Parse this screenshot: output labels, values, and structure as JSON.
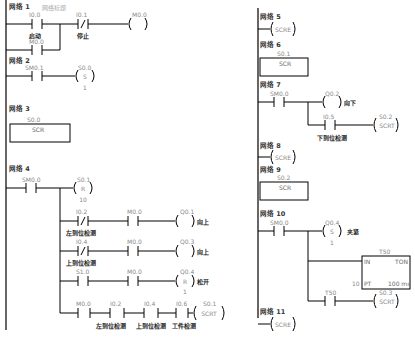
{
  "networks": [
    {
      "id": 1,
      "label": "网络 1",
      "title": "网络标题",
      "elements": [
        {
          "type": "no-contact",
          "addr": "I0.0",
          "comment": "启动"
        },
        {
          "type": "no-contact",
          "addr": "M0.0",
          "parallel": true
        },
        {
          "type": "nc-contact",
          "addr": "I0.1",
          "comment": "停止"
        },
        {
          "type": "coil",
          "addr": "M0.0"
        }
      ]
    },
    {
      "id": 2,
      "label": "网络 2",
      "elements": [
        {
          "type": "no-contact",
          "addr": "SM0.1"
        },
        {
          "type": "set-coil",
          "addr": "S0.0",
          "symbol": "S",
          "count": "1"
        }
      ]
    },
    {
      "id": 3,
      "label": "网络 3",
      "elements": [
        {
          "type": "box",
          "addr": "S0.0",
          "text": "SCR"
        }
      ]
    },
    {
      "id": 4,
      "label": "网络 4",
      "elements": [
        {
          "type": "no-contact",
          "addr": "SM0.0"
        },
        {
          "type": "reset-coil",
          "addr": "S0.1",
          "symbol": "R",
          "count": "10"
        },
        {
          "type": "nc-contact",
          "addr": "I0.2",
          "comment": "左到位检测"
        },
        {
          "type": "no-contact",
          "addr": "M0.0"
        },
        {
          "type": "coil",
          "addr": "Q0.1",
          "comment": "向上"
        },
        {
          "type": "nc-contact",
          "addr": "I0.4",
          "comment": "上到位检测"
        },
        {
          "type": "no-contact",
          "addr": "M0.0"
        },
        {
          "type": "coil",
          "addr": "Q0.3",
          "comment": "向上"
        },
        {
          "type": "no-contact",
          "addr": "S1.0"
        },
        {
          "type": "no-contact",
          "addr": "M0.0"
        },
        {
          "type": "reset-coil",
          "addr": "Q0.4",
          "symbol": "R",
          "count": "1",
          "comment": "松开"
        },
        {
          "type": "no-contact",
          "addr": "M0.0"
        },
        {
          "type": "no-contact",
          "addr": "I0.2",
          "comment": "左到位检测"
        },
        {
          "type": "no-contact",
          "addr": "I0.4",
          "comment": "上到位检测"
        },
        {
          "type": "no-contact",
          "addr": "I0.6",
          "comment": "工件检测"
        },
        {
          "type": "scrt-coil",
          "addr": "S0.1",
          "text": "SCRT"
        }
      ]
    },
    {
      "id": 5,
      "label": "网络 5",
      "elements": [
        {
          "type": "scre-coil",
          "text": "SCRE"
        }
      ]
    },
    {
      "id": 6,
      "label": "网络 6",
      "elements": [
        {
          "type": "box",
          "addr": "S0.1",
          "text": "SCR"
        }
      ]
    },
    {
      "id": 7,
      "label": "网络 7",
      "elements": [
        {
          "type": "no-contact",
          "addr": "SM0.0"
        },
        {
          "type": "coil",
          "addr": "Q0.2",
          "comment": "向下"
        },
        {
          "type": "no-contact",
          "addr": "I0.5",
          "comment": "下到位检测"
        },
        {
          "type": "scrt-coil",
          "addr": "S0.2",
          "text": "SCRT"
        }
      ]
    },
    {
      "id": 8,
      "label": "网络 8",
      "elements": [
        {
          "type": "scre-coil",
          "text": "SCRE"
        }
      ]
    },
    {
      "id": 9,
      "label": "网络 9",
      "elements": [
        {
          "type": "box",
          "addr": "S0.2",
          "text": "SCR"
        }
      ]
    },
    {
      "id": 10,
      "label": "网络 10",
      "elements": [
        {
          "type": "no-contact",
          "addr": "SM0.0"
        },
        {
          "type": "set-coil",
          "addr": "Q0.4",
          "symbol": "S",
          "count": "1",
          "comment": "夹紧"
        },
        {
          "type": "timer",
          "addr": "T50",
          "in": "IN",
          "kind": "TON",
          "pt_value": "10",
          "pt": "PT",
          "base": "100 ms"
        },
        {
          "type": "no-contact",
          "addr": "T50"
        },
        {
          "type": "scrt-coil",
          "addr": "S0.3",
          "text": "SCRT"
        }
      ]
    },
    {
      "id": 11,
      "label": "网络 11",
      "elements": [
        {
          "type": "scre-coil",
          "text": "SCRE"
        }
      ]
    }
  ],
  "t": {
    "n1": "网络 1",
    "n1title": "网络标题",
    "n2": "网络 2",
    "n3": "网络 3",
    "n4": "网络 4",
    "n5": "网络 5",
    "n6": "网络 6",
    "n7": "网络 7",
    "n8": "网络 8",
    "n9": "网络 9",
    "n10": "网络 10",
    "n11": "网络 11",
    "I00": "I0.0",
    "I01": "I0.1",
    "M00": "M0.0",
    "SM01": "SM0.1",
    "S00": "S0.0",
    "S01": "S0.1",
    "S02": "S0.2",
    "S03": "S0.3",
    "SM00": "SM0.0",
    "I02": "I0.2",
    "I04": "I0.4",
    "I05": "I0.5",
    "I06": "I0.6",
    "S10": "S1.0",
    "Q01": "Q0.1",
    "Q02": "Q0.2",
    "Q03": "Q0.3",
    "Q04": "Q0.4",
    "T50": "T50",
    "start": "启动",
    "stop": "停止",
    "leftdet": "左到位检测",
    "updet": "上到位检测",
    "downdet": "下到位检测",
    "workdet": "工件检测",
    "up": "向上",
    "down": "向下",
    "release": "松开",
    "clamp": "夹紧",
    "S": "S",
    "R": "R",
    "one": "1",
    "ten": "10",
    "SCR": "SCR",
    "SCRT": "SCRT",
    "SCRE": "SCRE",
    "IN": "IN",
    "TON": "TON",
    "PT": "PT",
    "ptval": "10",
    "ms": "100 ms"
  }
}
